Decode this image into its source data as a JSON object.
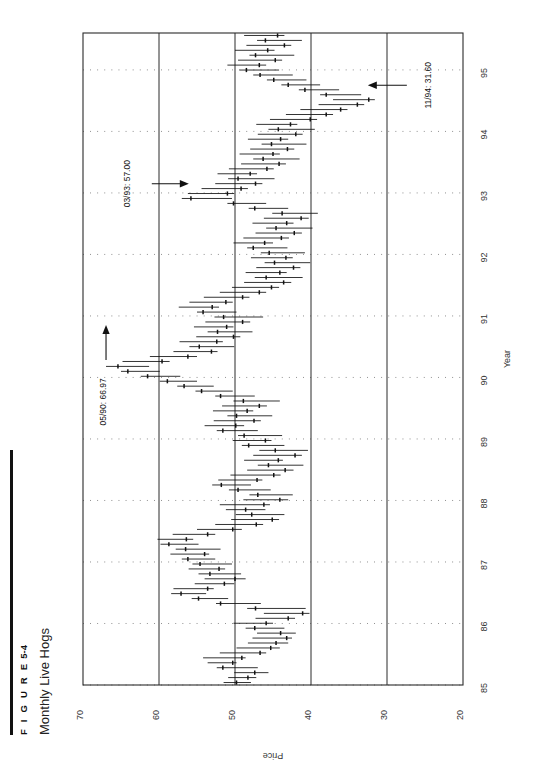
{
  "figure": {
    "number_label": "F I G U R E",
    "number": "5-4",
    "title": "Monthly Live Hogs"
  },
  "chart_data": {
    "type": "bar",
    "subtype": "high-low-close bar chart (rotated 90 degrees counter-clockwise)",
    "title": "Monthly Live Hogs",
    "xlabel": "Year",
    "ylabel": "Price",
    "xlim": [
      85,
      95.6
    ],
    "ylim": [
      20,
      70
    ],
    "y_inverted_on_page": true,
    "grid": "dotted gridlines every 1 year; solid vertical lines at price 60, 50, 40, 30",
    "legend": "none",
    "x_tick_labels": [
      "85",
      "86",
      "87",
      "88",
      "89",
      "90",
      "91",
      "92",
      "93",
      "94",
      "95"
    ],
    "y_tick_labels": [
      "70",
      "60",
      "50",
      "40",
      "30",
      "20"
    ],
    "y_ticks": [
      70,
      60,
      50,
      40,
      30,
      20
    ],
    "solid_gridlines": [
      60,
      50,
      40,
      30
    ],
    "annotations": [
      {
        "name": "high-1990",
        "text": "05/90: 66.97",
        "date": "05/90",
        "value": 66.97,
        "arrow": "up"
      },
      {
        "name": "mid-1993",
        "text": "03/93: 57.00",
        "date": "03/93",
        "value": 57.0,
        "arrow": "right"
      },
      {
        "name": "low-1994",
        "text": "11/94: 31.60",
        "date": "11/94",
        "value": 31.6,
        "arrow": "left"
      }
    ],
    "series": [
      {
        "name": "Monthly Live Hogs",
        "fields": [
          "date",
          "high",
          "low",
          "close"
        ],
        "values": [
          [
            "01/85",
            51.5,
            47.9,
            49.8
          ],
          [
            "02/85",
            50.9,
            47.2,
            48.3
          ],
          [
            "03/85",
            50.1,
            45.6,
            47.4
          ],
          [
            "04/85",
            52.4,
            47.0,
            51.6
          ],
          [
            "05/85",
            53.6,
            49.8,
            50.3
          ],
          [
            "06/85",
            54.2,
            48.6,
            49.1
          ],
          [
            "07/85",
            52.0,
            45.9,
            46.7
          ],
          [
            "08/85",
            49.8,
            44.1,
            45.3
          ],
          [
            "09/85",
            48.3,
            43.0,
            44.6
          ],
          [
            "10/85",
            47.7,
            42.5,
            43.2
          ],
          [
            "11/85",
            47.1,
            42.0,
            44.0
          ],
          [
            "12/85",
            48.6,
            43.5,
            47.4
          ],
          [
            "01/86",
            50.2,
            45.0,
            45.9
          ],
          [
            "02/86",
            47.3,
            42.1,
            43.0
          ],
          [
            "03/86",
            46.2,
            40.2,
            41.1
          ],
          [
            "04/86",
            48.4,
            40.7,
            47.3
          ],
          [
            "05/86",
            52.5,
            46.6,
            51.9
          ],
          [
            "06/86",
            55.7,
            50.9,
            54.8
          ],
          [
            "07/86",
            58.4,
            53.8,
            57.1
          ],
          [
            "08/86",
            58.1,
            52.8,
            53.6
          ],
          [
            "09/86",
            55.3,
            50.1,
            51.4
          ],
          [
            "10/86",
            54.0,
            48.6,
            50.0
          ],
          [
            "11/86",
            54.8,
            49.2,
            53.3
          ],
          [
            "12/86",
            56.1,
            51.3,
            52.1
          ],
          [
            "01/87",
            55.6,
            50.4,
            54.6
          ],
          [
            "02/87",
            57.0,
            52.6,
            56.2
          ],
          [
            "03/87",
            58.5,
            53.4,
            54.0
          ],
          [
            "04/87",
            57.8,
            51.9,
            56.5
          ],
          [
            "05/87",
            59.8,
            54.8,
            58.7
          ],
          [
            "06/87",
            60.2,
            55.5,
            56.4
          ],
          [
            "07/87",
            58.2,
            52.6,
            53.6
          ],
          [
            "08/87",
            55.0,
            49.1,
            50.3
          ],
          [
            "09/87",
            52.6,
            46.3,
            47.2
          ],
          [
            "10/87",
            50.5,
            44.2,
            45.1
          ],
          [
            "11/87",
            49.9,
            43.5,
            47.8
          ],
          [
            "12/87",
            51.2,
            46.0,
            48.6
          ],
          [
            "01/88",
            52.0,
            45.4,
            46.2
          ],
          [
            "02/88",
            48.9,
            43.0,
            44.1
          ],
          [
            "03/88",
            48.1,
            42.4,
            47.0
          ],
          [
            "04/88",
            50.8,
            45.3,
            49.6
          ],
          [
            "05/88",
            53.0,
            47.9,
            51.8
          ],
          [
            "06/88",
            52.2,
            46.4,
            47.1
          ],
          [
            "07/88",
            50.6,
            44.0,
            44.9
          ],
          [
            "08/88",
            48.4,
            42.3,
            43.4
          ],
          [
            "09/88",
            47.0,
            41.0,
            45.6
          ],
          [
            "10/88",
            48.8,
            43.7,
            44.3
          ],
          [
            "11/88",
            47.6,
            41.2,
            42.1
          ],
          [
            "12/88",
            46.8,
            40.4,
            44.7
          ],
          [
            "01/89",
            49.1,
            43.5,
            48.2
          ],
          [
            "02/89",
            50.3,
            45.2,
            46.0
          ],
          [
            "03/89",
            49.6,
            43.8,
            48.8
          ],
          [
            "04/89",
            52.4,
            47.0,
            51.6
          ],
          [
            "05/89",
            54.0,
            48.8,
            49.9
          ],
          [
            "06/89",
            52.8,
            46.6,
            47.5
          ],
          [
            "07/89",
            51.0,
            45.1,
            49.8
          ],
          [
            "08/89",
            52.9,
            47.6,
            48.4
          ],
          [
            "09/89",
            51.7,
            45.8,
            46.8
          ],
          [
            "10/89",
            50.2,
            44.1,
            48.9
          ],
          [
            "11/89",
            52.6,
            47.4,
            51.9
          ],
          [
            "12/89",
            55.2,
            50.3,
            54.4
          ],
          [
            "01/90",
            57.6,
            52.8,
            56.7
          ],
          [
            "02/90",
            59.9,
            55.0,
            58.9
          ],
          [
            "03/90",
            62.4,
            57.2,
            61.5
          ],
          [
            "04/90",
            65.0,
            59.9,
            64.1
          ],
          [
            "05/90",
            66.97,
            61.3,
            65.4
          ],
          [
            "06/90",
            64.8,
            58.6,
            59.6
          ],
          [
            "07/90",
            61.2,
            55.0,
            56.2
          ],
          [
            "08/90",
            58.1,
            52.3,
            53.1
          ],
          [
            "09/90",
            56.0,
            50.1,
            54.7
          ],
          [
            "10/90",
            57.3,
            51.6,
            52.4
          ],
          [
            "11/90",
            55.1,
            49.3,
            50.2
          ],
          [
            "12/90",
            53.6,
            47.7,
            52.3
          ],
          [
            "01/91",
            55.4,
            50.2,
            51.1
          ],
          [
            "02/91",
            53.9,
            48.0,
            49.0
          ],
          [
            "03/91",
            52.7,
            46.3,
            51.5
          ],
          [
            "04/91",
            55.0,
            49.8,
            54.2
          ],
          [
            "05/91",
            57.4,
            52.1,
            53.0
          ],
          [
            "06/91",
            56.0,
            50.3,
            51.2
          ],
          [
            "07/91",
            54.1,
            48.1,
            49.0
          ],
          [
            "08/91",
            52.0,
            45.9,
            46.8
          ],
          [
            "09/91",
            50.4,
            44.2,
            45.2
          ],
          [
            "10/91",
            48.8,
            42.6,
            43.6
          ],
          [
            "11/91",
            47.4,
            41.1,
            45.9
          ],
          [
            "12/91",
            48.6,
            43.2,
            44.1
          ],
          [
            "01/92",
            47.2,
            41.4,
            42.3
          ],
          [
            "02/92",
            46.1,
            40.1,
            44.8
          ],
          [
            "03/92",
            47.9,
            42.4,
            43.3
          ],
          [
            "04/92",
            46.6,
            40.8,
            45.5
          ],
          [
            "05/92",
            48.4,
            43.1,
            47.6
          ],
          [
            "06/92",
            50.2,
            45.0,
            46.1
          ],
          [
            "07/92",
            48.9,
            42.9,
            43.9
          ],
          [
            "08/92",
            47.3,
            41.2,
            42.2
          ],
          [
            "09/92",
            45.9,
            39.8,
            44.6
          ],
          [
            "10/92",
            47.7,
            42.3,
            43.2
          ],
          [
            "11/92",
            46.2,
            40.3,
            41.3
          ],
          [
            "12/92",
            45.1,
            39.1,
            43.8
          ],
          [
            "01/93",
            48.2,
            43.0,
            47.4
          ],
          [
            "02/93",
            51.0,
            45.9,
            50.2
          ],
          [
            "03/93",
            57.0,
            50.4,
            55.8
          ],
          [
            "04/93",
            56.2,
            50.1,
            51.0
          ],
          [
            "05/93",
            54.4,
            48.3,
            49.2
          ],
          [
            "06/93",
            52.6,
            46.4,
            47.3
          ],
          [
            "07/93",
            50.9,
            44.8,
            49.6
          ],
          [
            "08/93",
            52.3,
            47.1,
            48.0
          ],
          [
            "09/93",
            50.8,
            44.9,
            45.8
          ],
          [
            "10/93",
            49.2,
            43.3,
            44.2
          ],
          [
            "11/93",
            47.6,
            41.5,
            46.3
          ],
          [
            "12/93",
            49.4,
            44.1,
            45.0
          ],
          [
            "01/94",
            48.0,
            42.2,
            43.1
          ],
          [
            "02/94",
            46.5,
            40.6,
            45.2
          ],
          [
            "03/94",
            48.3,
            43.0,
            44.0
          ],
          [
            "04/94",
            47.0,
            41.1,
            42.0
          ],
          [
            "05/94",
            45.6,
            39.5,
            44.3
          ],
          [
            "06/94",
            47.2,
            41.8,
            42.7
          ],
          [
            "07/94",
            45.4,
            39.2,
            40.1
          ],
          [
            "08/94",
            43.3,
            37.1,
            38.0
          ],
          [
            "09/94",
            41.4,
            35.2,
            36.1
          ],
          [
            "10/94",
            39.0,
            33.0,
            33.9
          ],
          [
            "11/94",
            37.1,
            31.6,
            32.4
          ],
          [
            "12/94",
            38.8,
            33.4,
            38.0
          ],
          [
            "01/95",
            41.6,
            36.3,
            40.8
          ],
          [
            "02/95",
            43.9,
            38.8,
            43.0
          ],
          [
            "03/95",
            45.8,
            40.6,
            44.9
          ],
          [
            "04/95",
            47.6,
            42.4,
            46.7
          ],
          [
            "05/95",
            49.4,
            44.2,
            48.5
          ],
          [
            "06/95",
            51.0,
            45.9,
            46.8
          ],
          [
            "07/95",
            49.6,
            43.8,
            44.7
          ],
          [
            "08/95",
            48.1,
            42.2,
            47.3
          ],
          [
            "09/95",
            50.0,
            44.8,
            45.7
          ],
          [
            "10/95",
            48.5,
            42.6,
            43.5
          ],
          [
            "11/95",
            47.1,
            41.2,
            46.0
          ],
          [
            "12/95",
            48.8,
            43.5,
            44.4
          ]
        ]
      }
    ]
  }
}
